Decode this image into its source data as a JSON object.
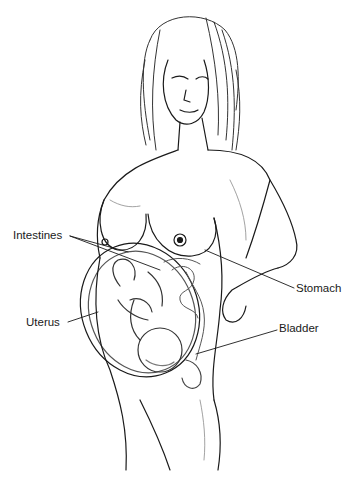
{
  "figure": {
    "style": "black and white pencil illustration",
    "colors": {
      "background": "#ffffff",
      "ink": "#1a1a1a",
      "shade": "#8a8a8a"
    }
  },
  "labels": [
    {
      "id": "intestines",
      "text": "Intestines",
      "x": 13,
      "y": 230,
      "line": [
        [
          70,
          236
        ],
        [
          128,
          252
        ]
      ],
      "line2": [
        [
          70,
          236
        ],
        [
          160,
          270
        ]
      ]
    },
    {
      "id": "stomach",
      "text": "Stomach",
      "x": 296,
      "y": 284,
      "line": [
        [
          294,
          288
        ],
        [
          205,
          250
        ]
      ]
    },
    {
      "id": "uterus",
      "text": "Uterus",
      "x": 26,
      "y": 318,
      "line": [
        [
          68,
          322
        ],
        [
          98,
          312
        ]
      ]
    },
    {
      "id": "bladder",
      "text": "Bladder",
      "x": 279,
      "y": 324,
      "line": [
        [
          277,
          330
        ],
        [
          196,
          354
        ]
      ]
    }
  ]
}
